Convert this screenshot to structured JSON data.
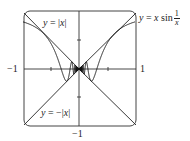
{
  "chart_data": {
    "type": "line",
    "title": "",
    "xlabel": "",
    "ylabel": "",
    "xlim": [
      -1,
      1
    ],
    "ylim": [
      -1,
      1
    ],
    "grid": false,
    "x_tick_labels": [
      "-1",
      "1"
    ],
    "y_tick_labels": [
      "-1"
    ],
    "series": [
      {
        "name": "y = |x|",
        "expression": "|x|",
        "style": "solid"
      },
      {
        "name": "y = -|x|",
        "expression": "-|x|",
        "style": "solid"
      },
      {
        "name": "y = x sin 1/x",
        "expression": "x*sin(1/x)",
        "style": "solid"
      }
    ],
    "annotations": [
      {
        "text": "y = |x|",
        "near": "upper-left"
      },
      {
        "text": "y = -|x|",
        "near": "lower-left"
      },
      {
        "text": "y = x sin 1/x",
        "near": "upper-right, outside plot"
      }
    ]
  },
  "labels": {
    "abs": "y = |x|",
    "negabs_prefix": "y = −|",
    "negabs_x": "x",
    "negabs_suffix": "|",
    "fn_prefix": "y = ",
    "fn_x": "x",
    "fn_sin": " sin ",
    "fn_num": "1",
    "fn_den": "x",
    "x_min": "−1",
    "x_max": "1",
    "y_min": "−1"
  },
  "colors": {
    "curve": "#222222",
    "axis": "#333333",
    "frame": "#444444"
  }
}
